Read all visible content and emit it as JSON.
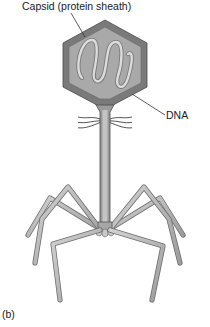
{
  "figure": {
    "panel_label": "(b)",
    "labels": {
      "capsid": "Capsid (protein sheath)",
      "dna": "DNA"
    },
    "parts": [
      "capsid",
      "dna",
      "tail-sheath",
      "tail-fibers",
      "base-plate",
      "whiskers"
    ],
    "colors": {
      "capsid_outer": "#7a7a7a",
      "capsid_inner": "#a9a9a9",
      "dna": "#dcdcdc",
      "tail": "#9a9a9a",
      "tail_core": "#c4c4c4",
      "legs": "#b8b8b8",
      "outline": "#4a4a4a",
      "text": "#1a1a1a"
    }
  }
}
